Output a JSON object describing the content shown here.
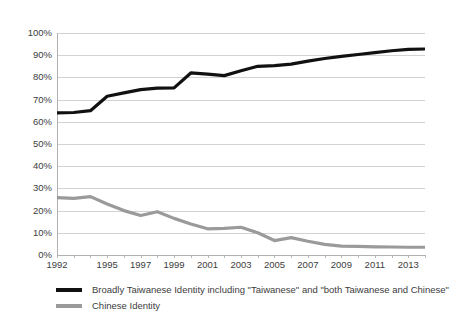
{
  "chart_data": {
    "type": "line",
    "title": "",
    "xlabel": "",
    "ylabel": "",
    "xlim": [
      1992,
      2014
    ],
    "ylim": [
      0,
      100
    ],
    "grid": true,
    "legend_position": "bottom-left",
    "x": [
      1992,
      1993,
      1994,
      1995,
      1996,
      1997,
      1998,
      1999,
      2000,
      2001,
      2002,
      2003,
      2004,
      2005,
      2006,
      2007,
      2008,
      2009,
      2010,
      2011,
      2012,
      2013,
      2014
    ],
    "xticklabels": [
      "1992",
      "1995",
      "1997",
      "1999",
      "2001",
      "2003",
      "2005",
      "2007",
      "2009",
      "2011",
      "2013"
    ],
    "xtickvalues": [
      1992,
      1995,
      1997,
      1999,
      2001,
      2003,
      2005,
      2007,
      2009,
      2011,
      2013
    ],
    "yticklabels": [
      "0%",
      "10%",
      "20%",
      "30%",
      "40%",
      "50%",
      "60%",
      "70%",
      "80%",
      "90%",
      "100%"
    ],
    "ytickvalues": [
      0,
      10,
      20,
      30,
      40,
      50,
      60,
      70,
      80,
      90,
      100
    ],
    "series": [
      {
        "name": "Broadly Taiwanese Identity including \"Taiwanese\" and \"both Taiwanese and Chinese\"",
        "color": "#111111",
        "width": 3.2,
        "values": [
          64.0,
          64.2,
          65.0,
          71.5,
          73.0,
          74.5,
          75.2,
          75.3,
          82.0,
          81.5,
          80.8,
          83.0,
          85.0,
          85.3,
          86.0,
          87.3,
          88.5,
          89.5,
          90.3,
          91.2,
          92.0,
          92.6,
          92.8
        ]
      },
      {
        "name": "Chinese Identity",
        "color": "#9a9a9a",
        "width": 3.2,
        "values": [
          25.8,
          25.5,
          26.3,
          23.0,
          20.0,
          17.8,
          19.5,
          16.5,
          14.0,
          11.8,
          12.0,
          12.5,
          10.0,
          6.5,
          7.8,
          6.2,
          4.8,
          4.0,
          3.9,
          3.7,
          3.6,
          3.5,
          3.5
        ]
      }
    ]
  },
  "legend": {
    "items": [
      {
        "label": "Broadly Taiwanese Identity including \"Taiwanese\" and \"both Taiwanese and Chinese\""
      },
      {
        "label": "Chinese Identity"
      }
    ]
  }
}
